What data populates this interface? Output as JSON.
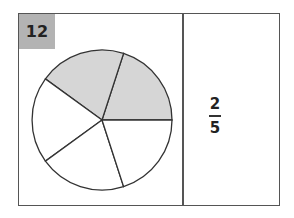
{
  "problem": {
    "number": "12",
    "label_bg": "#b3b3b3"
  },
  "pie": {
    "slices_total": 5,
    "slices_shaded": 2,
    "shade_color": "#d6d6d6",
    "stroke_color": "#333333"
  },
  "answer": {
    "numerator": "2",
    "denominator": "5"
  }
}
